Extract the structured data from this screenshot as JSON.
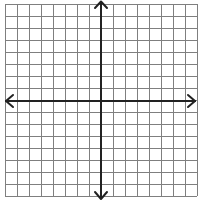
{
  "diagram": {
    "type": "coordinate-plane",
    "canvas": {
      "width": 200,
      "height": 201
    },
    "background": "#ffffff",
    "grid": {
      "cells_x": 16,
      "cells_y": 16,
      "origin_px": [
        5,
        4
      ],
      "spacing_px": 12,
      "line_color": "#7f7f7f",
      "line_width": 1
    },
    "axes": {
      "color": "#222222",
      "line_width": 2,
      "x_axis_y_px": 101,
      "y_axis_x_px": 101,
      "arrows": [
        "left-arrow",
        "right-arrow",
        "up-arrow",
        "down-arrow"
      ],
      "labels": []
    }
  }
}
